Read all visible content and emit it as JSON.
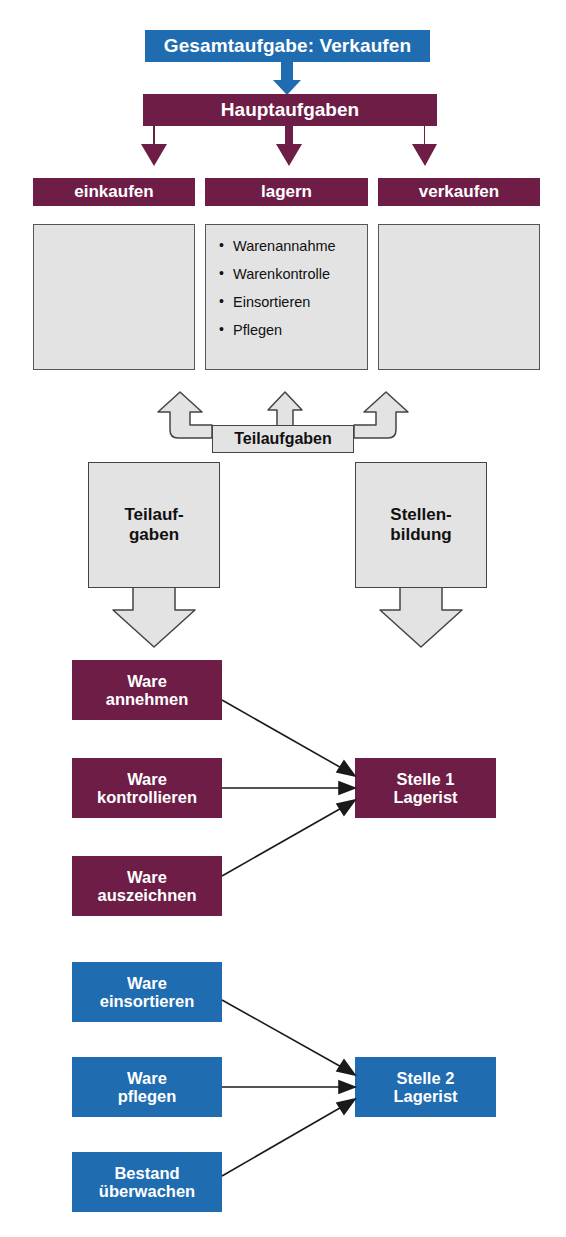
{
  "diagram": {
    "title": "Gesamtaufgabe: Verkaufen",
    "colors": {
      "blue": "#1f6cb0",
      "purple": "#6e1d46",
      "grey_fill": "#e3e3e3",
      "outline": "#444444",
      "white": "#ffffff"
    },
    "top": {
      "overall_task": "Gesamtaufgabe: Verkaufen",
      "main_tasks_label": "Hauptaufgaben",
      "columns": [
        {
          "heading": "einkaufen",
          "items": []
        },
        {
          "heading": "lagern",
          "items": [
            "Warenannahme",
            "Warenkontrolle",
            "Einsortieren",
            "Pflegen"
          ]
        },
        {
          "heading": "verkaufen",
          "items": []
        }
      ]
    },
    "middle": {
      "subtasks_pill": "Teilaufgaben",
      "left_box": "Teilauf-\ngaben",
      "left_box_line1": "Teilauf-",
      "left_box_line2": "gaben",
      "right_box": "Stellen-\nbildung",
      "right_box_line1": "Stellen-",
      "right_box_line2": "bildung"
    },
    "bottom": {
      "group_1": {
        "color": "#6e1d46",
        "tasks": [
          {
            "line1": "Ware",
            "line2": "annehmen"
          },
          {
            "line1": "Ware",
            "line2": "kontrollieren"
          },
          {
            "line1": "Ware",
            "line2": "auszeichnen"
          }
        ],
        "position": {
          "line1": "Stelle 1",
          "line2": "Lagerist"
        }
      },
      "group_2": {
        "color": "#1f6cb0",
        "tasks": [
          {
            "line1": "Ware",
            "line2": "einsortieren"
          },
          {
            "line1": "Ware",
            "line2": "pflegen"
          },
          {
            "line1": "Bestand",
            "line2": "überwachen"
          }
        ],
        "position": {
          "line1": "Stelle 2",
          "line2": "Lagerist"
        }
      }
    }
  }
}
